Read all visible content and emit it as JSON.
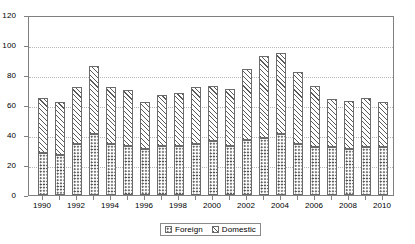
{
  "chart_data": {
    "type": "bar",
    "stacked": true,
    "title": "",
    "subtitle": "",
    "xlabel": "",
    "ylabel": "",
    "ylim": [
      0,
      120
    ],
    "ytick_step": 20,
    "yticks": [
      "0",
      "20",
      "40",
      "60",
      "80",
      "100",
      "120"
    ],
    "grid": "horizontal-dotted",
    "legend_position": "bottom-center",
    "categories": [
      "1990",
      "1991",
      "1992",
      "1993",
      "1994",
      "1995",
      "1996",
      "1997",
      "1998",
      "1999",
      "2000",
      "2001",
      "2002",
      "2003",
      "2004",
      "2005",
      "2006",
      "2007",
      "2008",
      "2009",
      "2010"
    ],
    "xtick_labels": [
      "1990",
      "1992",
      "1994",
      "1996",
      "1998",
      "2000",
      "2002",
      "2004",
      "2006",
      "2008",
      "2010"
    ],
    "series": [
      {
        "name": "Foreign",
        "pattern": "dotted",
        "values": [
          28,
          27,
          34,
          41,
          34,
          33,
          31,
          33,
          33,
          34,
          36,
          33,
          37,
          38,
          41,
          34,
          32,
          32,
          31,
          32,
          32
        ]
      },
      {
        "name": "Domestic",
        "pattern": "diagonal-hatch",
        "values": [
          37,
          35,
          38,
          45,
          38,
          37,
          31,
          34,
          35,
          38,
          37,
          38,
          47,
          55,
          54,
          48,
          41,
          32,
          32,
          33,
          30
        ]
      }
    ],
    "totals": [
      65,
      62,
      72,
      86,
      72,
      70,
      62,
      67,
      68,
      72,
      73,
      71,
      84,
      93,
      95,
      82,
      73,
      64,
      63,
      65,
      62
    ]
  },
  "legend": {
    "entries": [
      {
        "label": "Foreign",
        "swatch_name": "legend-swatch-foreign"
      },
      {
        "label": "Domestic",
        "swatch_name": "legend-swatch-domestic"
      }
    ]
  },
  "colors": {
    "axis": "#808080",
    "grid": "#b8b8b8",
    "bar_outline": "#6b6b6b",
    "pattern_ink": "#4a4a4a",
    "background": "#ffffff",
    "text": "#000000"
  }
}
